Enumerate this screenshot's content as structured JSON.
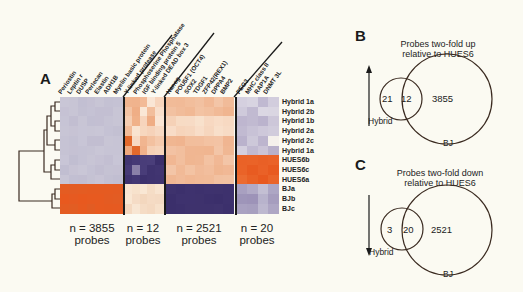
{
  "panel_a": {
    "label": "A",
    "genes_block1": [
      "Periostin",
      "Leptin r",
      "DUSP",
      "Perlecan",
      "Elastin",
      "ADH1B",
      "Myelin basic protein"
    ],
    "genes_block2": [
      "Y-linked protease",
      "Phosphoserine Phosphatase",
      "IGF binding protein 5",
      "Y-linked DEAD box 3"
    ],
    "genes_block3": [
      "Nanog",
      "POU5F1 (OCT4)",
      "SOX2",
      "TDGF1",
      "ZFP42(REX1)",
      "DPPA4",
      "BMP2"
    ],
    "genes_block4": [
      "PEG3",
      "MHC class II",
      "RAP1A",
      "DNMT 3L"
    ],
    "rows": [
      "Hybrid 1a",
      "Hybrid 2b",
      "Hybrid 1b",
      "Hybrid 2a",
      "Hybrid 2c",
      "Hybrid 1a",
      "HUES6b",
      "HUES6c",
      "HUES6a",
      "BJa",
      "BJb",
      "BJc"
    ],
    "blocks": [
      {
        "n_line": "n = 3855",
        "unit": "probes"
      },
      {
        "n_line": "n = 12",
        "unit": "probes"
      },
      {
        "n_line": "n = 2521",
        "unit": "probes"
      },
      {
        "n_line": "n = 20",
        "unit": "probes"
      }
    ],
    "colors": {
      "high": "#e8591f",
      "low": "#3b2f6b",
      "neutral": "#c9c6d6",
      "pale": "#f3d6bd"
    }
  },
  "panel_b": {
    "label": "B",
    "title_line1": "Probes two-fold up",
    "title_line2": "relative to HUES6",
    "hybrid_only": "21",
    "overlap": "12",
    "bj_only": "3855",
    "hybrid_label": "Hybrid",
    "bj_label": "BJ",
    "arrow": "up-arrow"
  },
  "panel_c": {
    "label": "C",
    "title_line1": "Probes two-fold down",
    "title_line2": "relative to HUES6",
    "hybrid_only": "3",
    "overlap": "20",
    "bj_only": "2521",
    "hybrid_label": "Hybrid",
    "bj_label": "BJ",
    "arrow": "down-arrow"
  },
  "chart_data": {
    "type": "heatmap",
    "title": "",
    "rows": [
      "Hybrid 1a",
      "Hybrid 2b",
      "Hybrid 1b",
      "Hybrid 2a",
      "Hybrid 2c",
      "Hybrid 1a",
      "HUES6b",
      "HUES6c",
      "HUES6a",
      "BJa",
      "BJb",
      "BJc"
    ],
    "column_groups": [
      {
        "n_probes": 3855,
        "genes": [
          "Periostin",
          "Leptin r",
          "DUSP",
          "Perlecan",
          "Elastin",
          "ADH1B",
          "Myelin basic protein"
        ],
        "pattern": "high in BJ, neutral elsewhere"
      },
      {
        "n_probes": 12,
        "genes": [
          "Y-linked protease",
          "Phosphoserine Phosphatase",
          "IGF binding protein 5",
          "Y-linked DEAD box 3"
        ],
        "pattern": "high in hybrids, low in HUES6"
      },
      {
        "n_probes": 2521,
        "genes": [
          "Nanog",
          "POU5F1 (OCT4)",
          "SOX2",
          "TDGF1",
          "ZFP42(REX1)",
          "DPPA4",
          "BMP2"
        ],
        "pattern": "high in hybrids and HUES6, low in BJ"
      },
      {
        "n_probes": 20,
        "genes": [
          "PEG3",
          "MHC class II",
          "RAP1A",
          "DNMT 3L"
        ],
        "pattern": "high in HUES6, neutral elsewhere"
      }
    ],
    "venn": [
      {
        "panel": "B",
        "title": "Probes two-fold up relative to HUES6",
        "sets": [
          "Hybrid",
          "BJ"
        ],
        "hybrid_only": 21,
        "overlap": 12,
        "bj_only": 3855
      },
      {
        "panel": "C",
        "title": "Probes two-fold down relative to HUES6",
        "sets": [
          "Hybrid",
          "BJ"
        ],
        "hybrid_only": 3,
        "overlap": 20,
        "bj_only": 2521
      }
    ]
  }
}
